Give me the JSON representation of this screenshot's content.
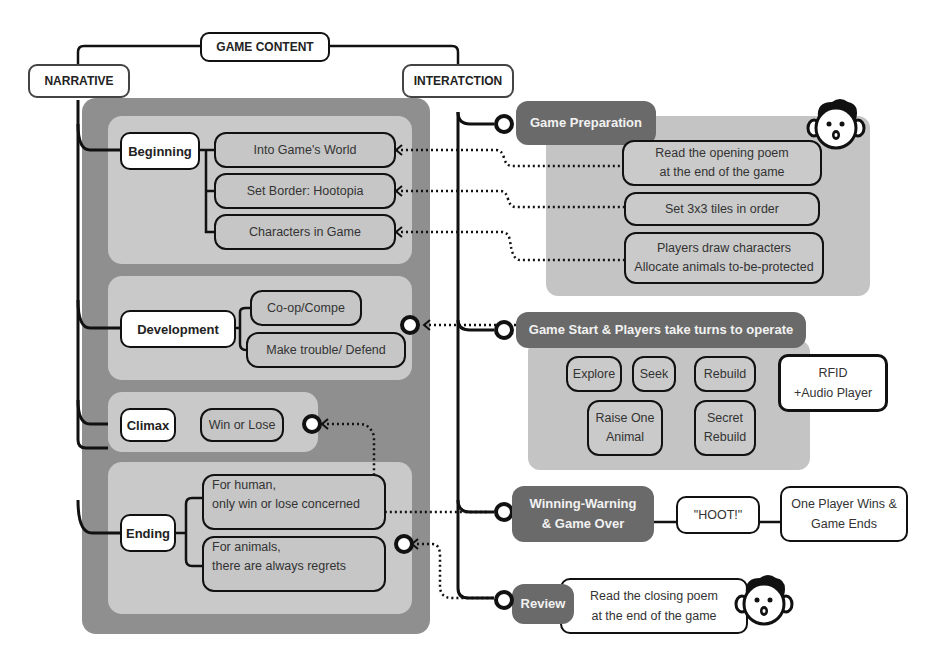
{
  "diagram": {
    "root": "GAME CONTENT",
    "branches": {
      "narrative": "NARRATIVE",
      "interaction": "INTERATCTION"
    },
    "narrative": {
      "beginning": {
        "label": "Beginning",
        "items": [
          "Into Game's World",
          "Set Border: Hootopia",
          "Characters in Game"
        ]
      },
      "development": {
        "label": "Development",
        "items": [
          "Co-op/Compe",
          "Make trouble/ Defend"
        ]
      },
      "climax": {
        "label": "Climax",
        "items": [
          "Win or Lose"
        ]
      },
      "ending": {
        "label": "Ending",
        "items": [
          {
            "line1": "For human,",
            "line2": "only win or lose concerned"
          },
          {
            "line1": "For animals,",
            "line2": "there are always regrets"
          }
        ]
      }
    },
    "interaction": {
      "preparation": {
        "label": "Game Preparation",
        "items": [
          {
            "line1": "Read the opening poem",
            "line2": "at the end of the game"
          },
          {
            "line1": "Set 3x3 tiles in order",
            "line2": ""
          },
          {
            "line1": "Players draw characters",
            "line2": "Allocate animals to-be-protected"
          }
        ]
      },
      "game_start": {
        "label": "Game Start & Players take turns to operate",
        "actions": {
          "explore": "Explore",
          "seek": "Seek",
          "rebuild": "Rebuild",
          "raise_line1": "Raise One",
          "raise_line2": "Animal",
          "secret_line1": "Secret",
          "secret_line2": "Rebuild"
        },
        "device_line1": "RFID",
        "device_line2": "+Audio Player"
      },
      "winning": {
        "label_line1": "Winning-Warning",
        "label_line2": "& Game Over",
        "sound": "\"HOOT!\"",
        "result_line1": "One Player Wins &",
        "result_line2": "Game Ends"
      },
      "review": {
        "label": "Review",
        "line1": "Read the closing poem",
        "line2": "at the end of the game"
      }
    },
    "colors": {
      "outer_panel": "#8f8f8f",
      "inner_panel": "#c9c9c9",
      "phase_fill": "#6a6a6a",
      "line": "#111111"
    }
  }
}
